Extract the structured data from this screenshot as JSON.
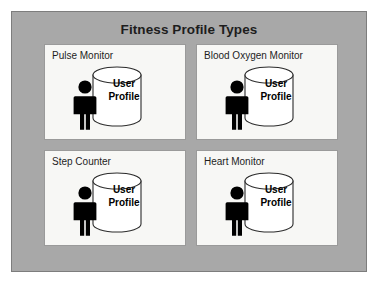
{
  "diagram": {
    "title": "Fitness Profile Types",
    "frame_color": "#a8a8a8",
    "frame_border_color": "#7d7d7d",
    "panel_fill": "#f7f7f5",
    "panel_border_color": "#9a9a9a",
    "text_color": "#1d1d1d",
    "person_icon_color": "#000000",
    "cylinder_fill": "#ffffff",
    "cylinder_stroke": "#2b2b2b",
    "panels": [
      {
        "label": "Pulse Monitor",
        "store_line1": "User",
        "store_line2": "Profile",
        "person_icon": "person-icon",
        "store_icon": "database-cylinder-icon"
      },
      {
        "label": "Blood Oxygen Monitor",
        "store_line1": "User",
        "store_line2": "Profile",
        "person_icon": "person-icon",
        "store_icon": "database-cylinder-icon"
      },
      {
        "label": "Step Counter",
        "store_line1": "User",
        "store_line2": "Profile",
        "person_icon": "person-icon",
        "store_icon": "database-cylinder-icon"
      },
      {
        "label": "Heart Monitor",
        "store_line1": "User",
        "store_line2": "Profile",
        "person_icon": "person-icon",
        "store_icon": "database-cylinder-icon"
      }
    ]
  }
}
